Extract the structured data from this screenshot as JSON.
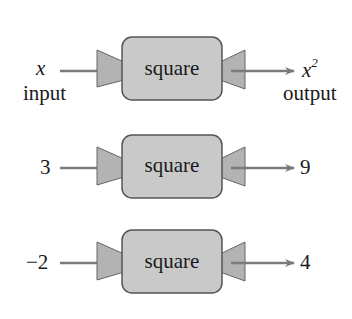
{
  "machines": [
    {
      "label": "square",
      "input": {
        "value": "x",
        "caption": "input",
        "italic": true
      },
      "output": {
        "value": "x",
        "exponent": "2",
        "caption": "output",
        "italic": true
      }
    },
    {
      "label": "square",
      "input": {
        "value": "3"
      },
      "output": {
        "value": "9"
      }
    },
    {
      "label": "square",
      "input": {
        "value": "−2"
      },
      "output": {
        "value": "4"
      }
    }
  ],
  "colors": {
    "box_fill": "#c9c9c9",
    "box_stroke": "#555555",
    "funnel_fill": "#b3b3b3",
    "arrow": "#7a7a7a"
  }
}
